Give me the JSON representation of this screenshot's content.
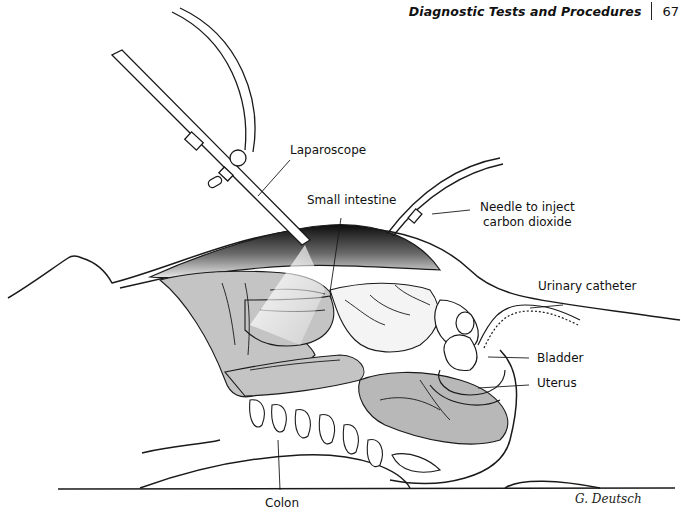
{
  "running_head": {
    "title": "Diagnostic Tests and Procedures",
    "page_number": "67"
  },
  "figure": {
    "labels": {
      "laparoscope": "Laparoscope",
      "small_intestine": "Small intestine",
      "needle_line1": "Needle to inject",
      "needle_line2": "carbon dioxide",
      "urinary_catheter": "Urinary catheter",
      "bladder": "Bladder",
      "uterus": "Uterus",
      "colon": "Colon"
    },
    "signature": "G. Deutsch",
    "colors": {
      "line": "#1a1a1a",
      "organ_fill": "#c4c4c4",
      "organ_dark": "#a8a8a8",
      "cavity_dark": "#111111"
    }
  }
}
